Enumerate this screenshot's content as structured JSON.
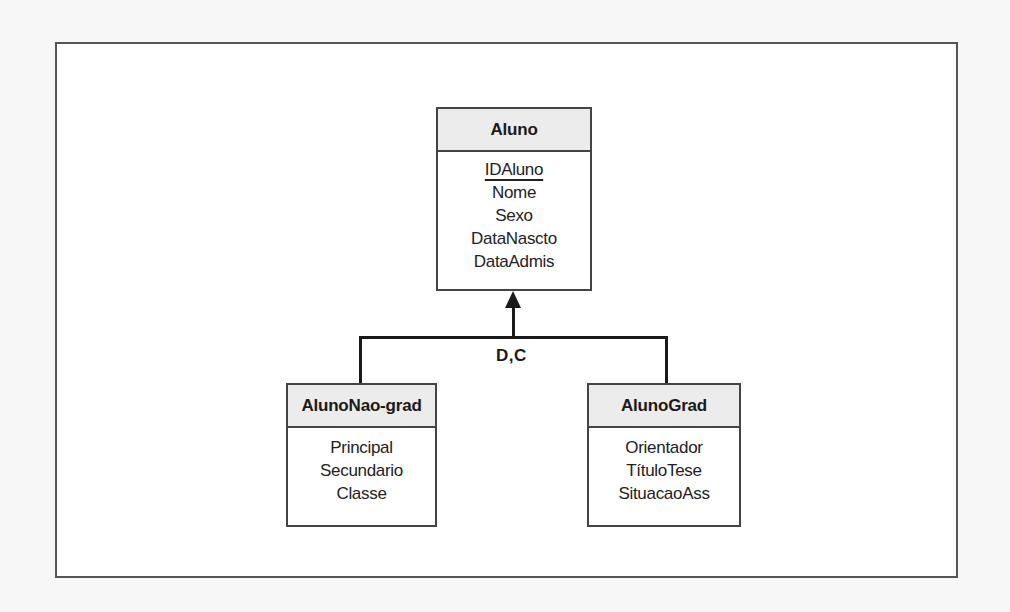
{
  "diagram": {
    "type": "EER specialization/generalization diagram",
    "superclass": {
      "name": "Aluno",
      "attributes": [
        {
          "name": "IDAluno",
          "primary_key": true
        },
        {
          "name": "Nome",
          "primary_key": false
        },
        {
          "name": "Sexo",
          "primary_key": false
        },
        {
          "name": "DataNascto",
          "primary_key": false
        },
        {
          "name": "DataAdmis",
          "primary_key": false
        }
      ]
    },
    "specialization": {
      "label": "D,C",
      "arrow": "points-to-superclass"
    },
    "subclasses": [
      {
        "name": "AlunoNao-grad",
        "attributes": [
          "Principal",
          "Secundario",
          "Classe"
        ]
      },
      {
        "name": "AlunoGrad",
        "attributes": [
          "Orientador",
          "TítuloTese",
          "SituacaoAss"
        ]
      }
    ]
  },
  "colors": {
    "border": "#444444",
    "header_fill": "#ececec",
    "connector": "#1a1a1a",
    "frame": "#555555"
  }
}
